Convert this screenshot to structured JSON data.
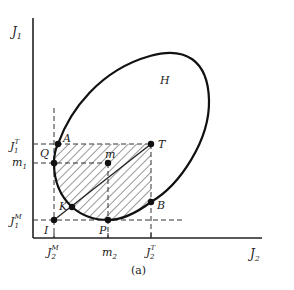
{
  "figure": {
    "caption": "(a)",
    "axes": {
      "y_label": "J",
      "y_label_sub": "1",
      "x_label": "J",
      "x_label_sub": "2"
    },
    "y_ticks": [
      {
        "base": "J",
        "sub": "1",
        "sup": "T"
      },
      {
        "base": "m",
        "sub": "1",
        "sup": ""
      },
      {
        "base": "J",
        "sub": "1",
        "sup": "M"
      }
    ],
    "x_ticks": [
      {
        "base": "J",
        "sub": "2",
        "sup": "M"
      },
      {
        "base": "m",
        "sub": "2",
        "sup": ""
      },
      {
        "base": "J",
        "sub": "2",
        "sup": "T"
      }
    ],
    "region_label": "H",
    "points": {
      "A": "A",
      "Q": "Q",
      "K": "K",
      "P": "P",
      "B": "B",
      "T": "T",
      "m": "m",
      "I": "I"
    }
  }
}
